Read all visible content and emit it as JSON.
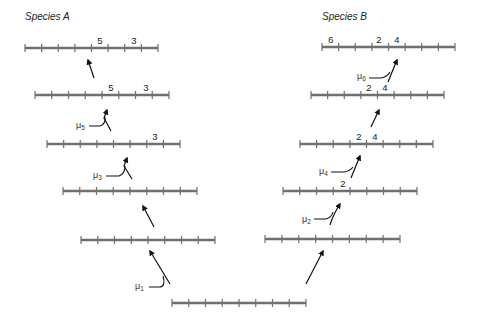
{
  "titles": {
    "left": "Species A",
    "right": "Species B"
  },
  "colors": {
    "line": "#707070",
    "arrow": "#111111",
    "text": "#222222"
  },
  "chromosomes": {
    "root": {
      "y": 303,
      "x1": 172,
      "x2": 306,
      "labels": []
    },
    "left": [
      {
        "y": 240,
        "x1": 81,
        "x2": 215,
        "labels": []
      },
      {
        "y": 191,
        "x1": 63,
        "x2": 197,
        "labels": []
      },
      {
        "y": 144,
        "x1": 47,
        "x2": 180,
        "labels": [
          {
            "text": "3",
            "x": 155
          }
        ]
      },
      {
        "y": 95,
        "x1": 35,
        "x2": 169,
        "labels": [
          {
            "text": "5",
            "x": 111
          },
          {
            "text": "3",
            "x": 146
          }
        ]
      },
      {
        "y": 48,
        "x1": 25,
        "x2": 158,
        "labels": [
          {
            "text": "5",
            "x": 100
          },
          {
            "text": "3",
            "x": 134
          }
        ]
      }
    ],
    "right": [
      {
        "y": 239,
        "x1": 265,
        "x2": 400,
        "labels": []
      },
      {
        "y": 191,
        "x1": 283,
        "x2": 417,
        "labels": [
          {
            "text": "2",
            "x": 343
          }
        ]
      },
      {
        "y": 144,
        "x1": 300,
        "x2": 433,
        "labels": [
          {
            "text": "2",
            "x": 359
          },
          {
            "text": "4",
            "x": 375
          }
        ]
      },
      {
        "y": 95,
        "x1": 311,
        "x2": 444,
        "labels": [
          {
            "text": "2",
            "x": 369
          },
          {
            "text": "4",
            "x": 385
          }
        ]
      },
      {
        "y": 47,
        "x1": 322,
        "x2": 455,
        "labels": [
          {
            "text": "6",
            "x": 331
          },
          {
            "text": "2",
            "x": 379
          },
          {
            "text": "4",
            "x": 397
          }
        ]
      }
    ]
  },
  "mutations": [
    {
      "symbol": "μ",
      "index": "1",
      "x": 135,
      "y": 289
    },
    {
      "symbol": "μ",
      "index": "2",
      "x": 302,
      "y": 222
    },
    {
      "symbol": "μ",
      "index": "3",
      "x": 93,
      "y": 178
    },
    {
      "symbol": "μ",
      "index": "4",
      "x": 319,
      "y": 174
    },
    {
      "symbol": "μ",
      "index": "5",
      "x": 76,
      "y": 128
    },
    {
      "symbol": "μ",
      "index": "6",
      "x": 357,
      "y": 79
    }
  ]
}
